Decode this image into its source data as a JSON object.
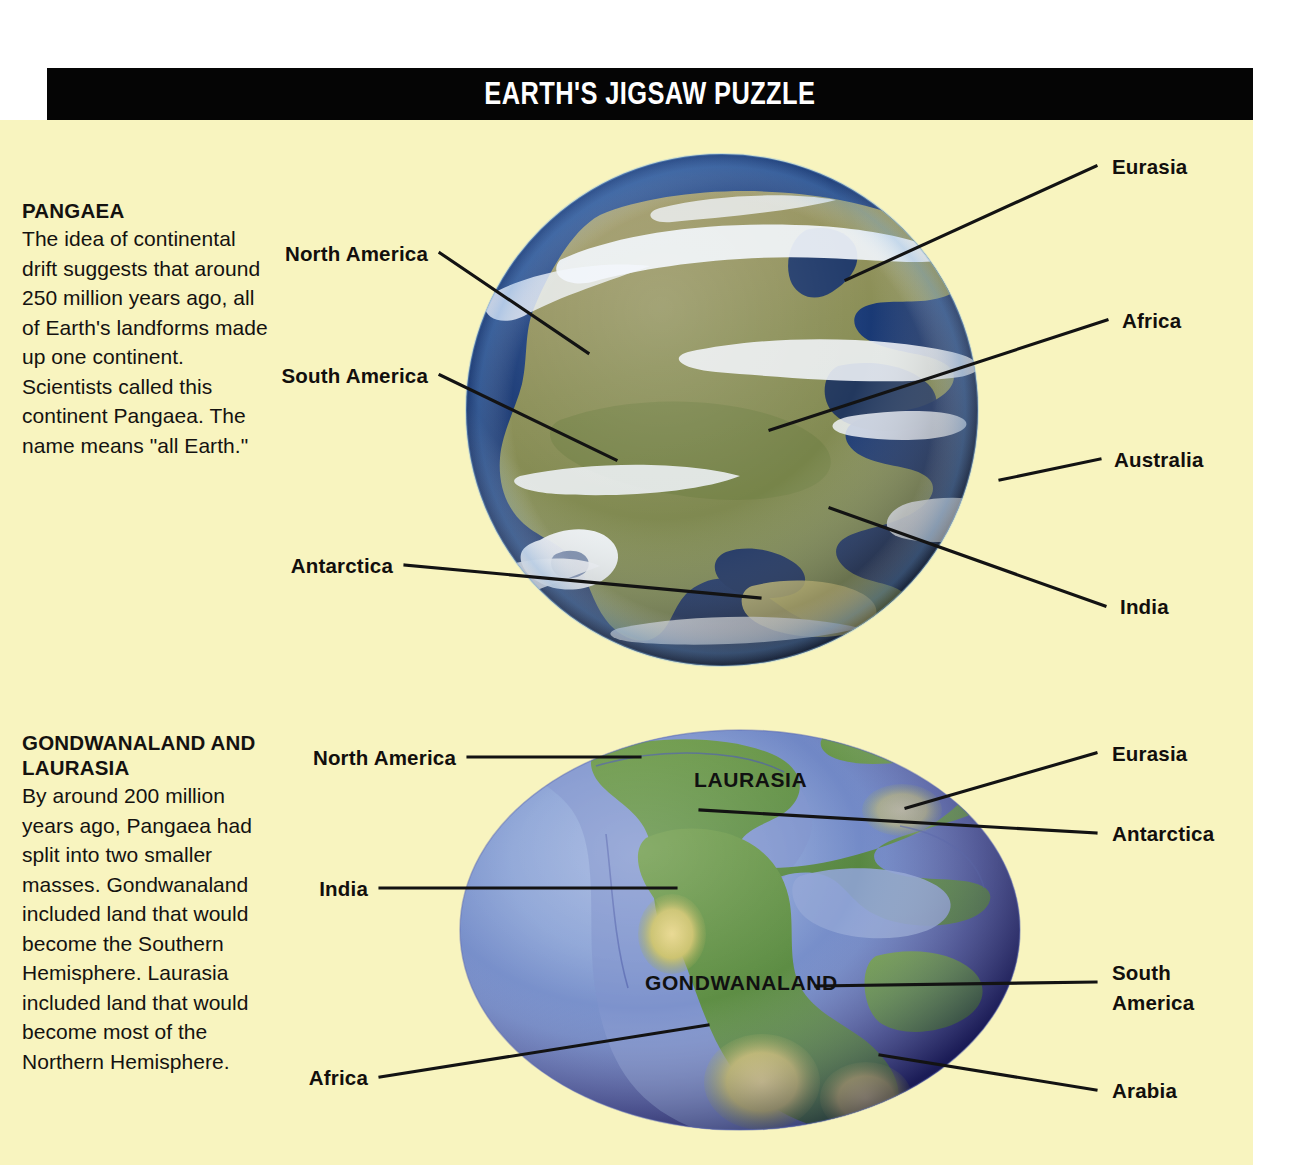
{
  "header": {
    "title": "EARTH'S JIGSAW PUZZLE",
    "background_color": "#050505",
    "text_color": "#ffffff"
  },
  "page": {
    "background_color": "#ffffff",
    "content_background_color": "#f8f4bf"
  },
  "sections": [
    {
      "id": "pangaea",
      "heading": "PANGAEA",
      "body": "The idea of continental drift suggests that around 250 million years ago, all of Earth's landforms made up one continent. Scientists called this continent Pangaea. The name means \"all Earth.\""
    },
    {
      "id": "gondwanaland",
      "heading": "GONDWANALAND AND LAURASIA",
      "body": "By around 200 million years ago, Pangaea had split into two smaller masses. Gondwanaland included land that would become the Southern Hemisphere. Laurasia included land that would become most of the Northern Hemisphere."
    }
  ],
  "figures": [
    {
      "id": "pangaea-globe",
      "type": "sphere",
      "description": "satellite-style globe showing the single Pangaea supercontinent",
      "labels": [
        {
          "text": "North America",
          "side": "left"
        },
        {
          "text": "South America",
          "side": "left"
        },
        {
          "text": "Antarctica",
          "side": "left"
        },
        {
          "text": "Eurasia",
          "side": "right"
        },
        {
          "text": "Africa",
          "side": "right"
        },
        {
          "text": "Australia",
          "side": "right"
        },
        {
          "text": "India",
          "side": "right"
        }
      ]
    },
    {
      "id": "gondwanaland-globe",
      "type": "ellipse",
      "description": "relief globe showing Pangaea split into Laurasia and Gondwanaland",
      "map_labels": [
        {
          "text": "LAURASIA"
        },
        {
          "text": "GONDWANALAND"
        }
      ],
      "labels": [
        {
          "text": "North America",
          "side": "left"
        },
        {
          "text": "India",
          "side": "left"
        },
        {
          "text": "Africa",
          "side": "left"
        },
        {
          "text": "Eurasia",
          "side": "right"
        },
        {
          "text": "Antarctica",
          "side": "right"
        },
        {
          "text": "South America",
          "side": "right"
        },
        {
          "text": "Arabia",
          "side": "right"
        }
      ]
    }
  ],
  "colors": {
    "background": "#f8f4bf",
    "title_band": "#050505",
    "leader_line": "#131313",
    "text": "#141210",
    "ocean_deep": "#0d1f4d",
    "ocean_mid": "#1f3f82",
    "land_tan": "#8e8b5e",
    "land_green": "#5e8a44",
    "land_yellow": "#d8d06a",
    "cloud": "#f2f6fb"
  }
}
